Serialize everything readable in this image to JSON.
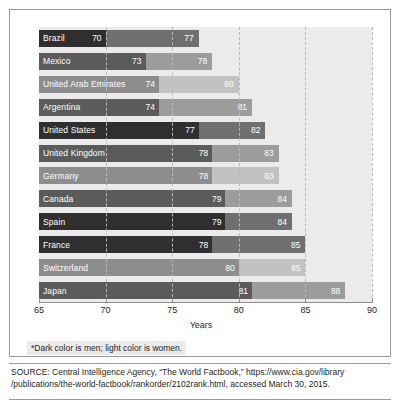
{
  "chart_data": {
    "type": "bar",
    "orientation": "horizontal",
    "title": "",
    "xlabel": "Years",
    "ylabel": "",
    "xlim": [
      65,
      90
    ],
    "xticks": [
      65,
      70,
      75,
      80,
      85,
      90
    ],
    "grid": "vertical-dashed",
    "legend": "none",
    "categories": [
      "Brazil",
      "Mexico",
      "United Arab Emirates",
      "Argentina",
      "United States",
      "United Kingdom",
      "Germany",
      "Canada",
      "Spain",
      "France",
      "Switzerland",
      "Japan"
    ],
    "series": [
      {
        "name": "Men",
        "values": [
          70,
          73,
          74,
          74,
          77,
          78,
          78,
          79,
          79,
          78,
          80,
          81
        ]
      },
      {
        "name": "Women",
        "values": [
          77,
          78,
          80,
          81,
          82,
          83,
          83,
          84,
          84,
          85,
          85,
          88
        ]
      }
    ],
    "rows": [
      {
        "country": "Brazil",
        "men": 70,
        "women": 77,
        "tone": "tone-a"
      },
      {
        "country": "Mexico",
        "men": 73,
        "women": 78,
        "tone": "tone-b"
      },
      {
        "country": "United Arab Emirates",
        "men": 74,
        "women": 80,
        "tone": "tone-c"
      },
      {
        "country": "Argentina",
        "men": 74,
        "women": 81,
        "tone": "tone-b"
      },
      {
        "country": "United States",
        "men": 77,
        "women": 82,
        "tone": "tone-a"
      },
      {
        "country": "United Kingdom",
        "men": 78,
        "women": 83,
        "tone": "tone-b"
      },
      {
        "country": "Germany",
        "men": 78,
        "women": 83,
        "tone": "tone-c"
      },
      {
        "country": "Canada",
        "men": 79,
        "women": 84,
        "tone": "tone-b"
      },
      {
        "country": "Spain",
        "men": 79,
        "women": 84,
        "tone": "tone-a"
      },
      {
        "country": "France",
        "men": 78,
        "women": 85,
        "tone": "tone-a"
      },
      {
        "country": "Switzerland",
        "men": 80,
        "women": 85,
        "tone": "tone-c"
      },
      {
        "country": "Japan",
        "men": 81,
        "women": 88,
        "tone": "tone-b"
      }
    ]
  },
  "footnote": {
    "text": "*Dark color is men; light color is women."
  },
  "source": {
    "line1": "SOURCE: Central Intelligence Agency, “The World Factbook,” https://www.cia.gov/library",
    "line2": "/publications/the-world-factbook/rankorder/2102rank.html, accessed March 30, 2015."
  },
  "colors": {
    "plot_background": "#ebebeb",
    "men_dark": "#2f2f2f",
    "men_mid": "#5b5b5b",
    "men_light": "#8d8d8d",
    "women_dark": "#6f6f6f",
    "women_mid": "#9c9c9c",
    "women_light": "#c2c2c2",
    "gridline": "#b9b9b9",
    "text": "#231f20"
  }
}
